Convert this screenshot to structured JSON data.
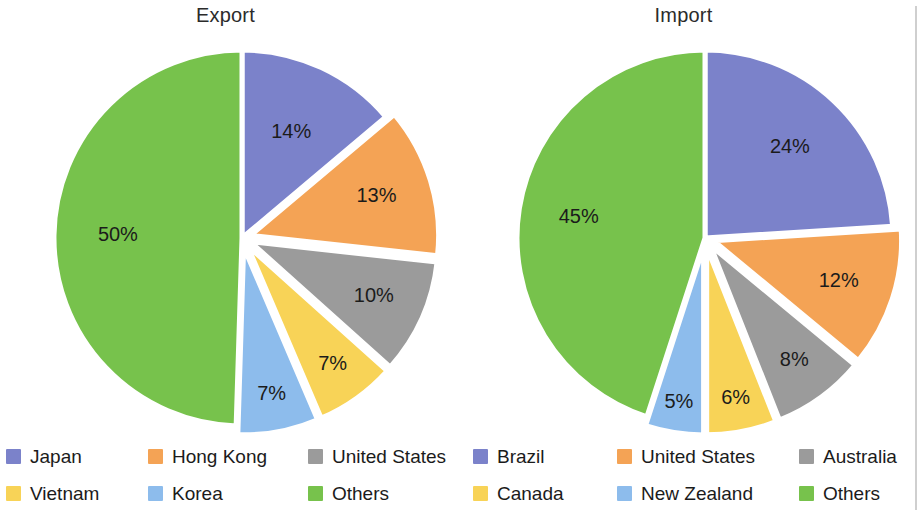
{
  "figure": {
    "divider": "vertical-rule",
    "background": "#ffffff"
  },
  "palette": {
    "blue": "#7b82ca",
    "orange": "#f4a355",
    "gray": "#9b9b9b",
    "yellow": "#f8d357",
    "light_blue": "#8dbcec",
    "green": "#77c24c",
    "text": "#1b1b1b",
    "divider": "#cfcfcf"
  },
  "charts": [
    {
      "title": "Export",
      "legend": [
        {
          "label": "Japan",
          "color": "#7b82ca"
        },
        {
          "label": "Hong Kong",
          "color": "#f4a355"
        },
        {
          "label": "United States",
          "color": "#9b9b9b"
        },
        {
          "label": "Vietnam",
          "color": "#f8d357"
        },
        {
          "label": "Korea",
          "color": "#8dbcec"
        },
        {
          "label": "Others",
          "color": "#77c24c"
        }
      ],
      "slice_labels": [
        "14%",
        "13%",
        "10%",
        "7%",
        "7%",
        "50%"
      ]
    },
    {
      "title": "Import",
      "legend": [
        {
          "label": "Brazil",
          "color": "#7b82ca"
        },
        {
          "label": "United States",
          "color": "#f4a355"
        },
        {
          "label": "Australia",
          "color": "#9b9b9b"
        },
        {
          "label": "Canada",
          "color": "#f8d357"
        },
        {
          "label": "New Zealand",
          "color": "#8dbcec"
        },
        {
          "label": "Others",
          "color": "#77c24c"
        }
      ],
      "slice_labels": [
        "24%",
        "12%",
        "8%",
        "6%",
        "5%",
        "45%"
      ]
    }
  ],
  "chart_data": [
    {
      "type": "pie",
      "title": "Export",
      "categories": [
        "Japan",
        "Hong Kong",
        "United States",
        "Vietnam",
        "Korea",
        "Others"
      ],
      "values": [
        14,
        13,
        10,
        7,
        7,
        50
      ],
      "value_labels": [
        "14%",
        "13%",
        "10%",
        "7%",
        "7%",
        "50%"
      ],
      "colors": [
        "#7b82ca",
        "#f4a355",
        "#9b9b9b",
        "#f8d357",
        "#8dbcec",
        "#77c24c"
      ],
      "unit": "%",
      "start_angle_deg": 0,
      "direction": "clockwise",
      "exploded": [
        false,
        true,
        true,
        true,
        true,
        false
      ],
      "legend_position": "bottom",
      "grid": false
    },
    {
      "type": "pie",
      "title": "Import",
      "categories": [
        "Brazil",
        "United States",
        "Australia",
        "Canada",
        "New Zealand",
        "Others"
      ],
      "values": [
        24,
        12,
        8,
        6,
        5,
        45
      ],
      "value_labels": [
        "24%",
        "12%",
        "8%",
        "6%",
        "5%",
        "45%"
      ],
      "colors": [
        "#7b82ca",
        "#f4a355",
        "#9b9b9b",
        "#f8d357",
        "#8dbcec",
        "#77c24c"
      ],
      "unit": "%",
      "start_angle_deg": 0,
      "direction": "clockwise",
      "exploded": [
        false,
        true,
        true,
        true,
        true,
        false
      ],
      "legend_position": "bottom",
      "grid": false
    }
  ]
}
